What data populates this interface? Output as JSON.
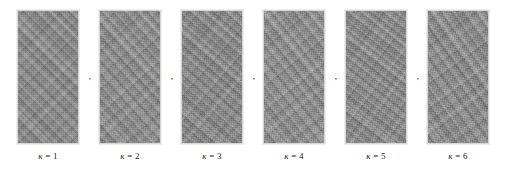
{
  "figure": {
    "type": "image-panel-row",
    "panel_count": 6,
    "background_color": "#ffffff",
    "panel_border_color": "#d8d8d8",
    "texture_mid_gray": "#949494",
    "caption_color": "#1a1a1a",
    "separator_mark": ","
  },
  "panels": [
    {
      "index": 1,
      "caption_symbol": "κ",
      "caption_relation": " = ",
      "caption_value": "1",
      "caption_full": "κ = 1",
      "separator": ","
    },
    {
      "index": 2,
      "caption_symbol": "κ",
      "caption_relation": " = ",
      "caption_value": "2",
      "caption_full": "κ = 2",
      "separator": ","
    },
    {
      "index": 3,
      "caption_symbol": "κ",
      "caption_relation": " = ",
      "caption_value": "3",
      "caption_full": "κ = 3",
      "separator": ","
    },
    {
      "index": 4,
      "caption_symbol": "κ",
      "caption_relation": " = ",
      "caption_value": "4",
      "caption_full": "κ = 4",
      "separator": ","
    },
    {
      "index": 5,
      "caption_symbol": "κ",
      "caption_relation": " = ",
      "caption_value": "5",
      "caption_full": "κ = 5",
      "separator": ","
    },
    {
      "index": 6,
      "caption_symbol": "κ",
      "caption_relation": " = ",
      "caption_value": "6",
      "caption_full": "κ = 6",
      "separator": ""
    }
  ]
}
